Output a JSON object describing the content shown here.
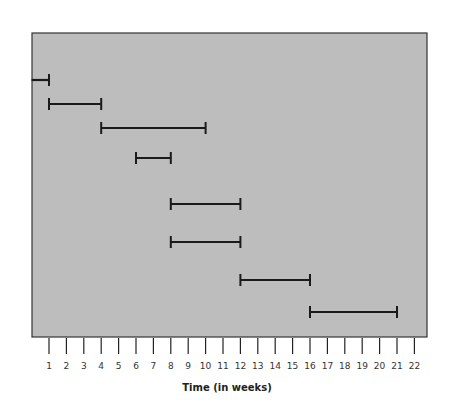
{
  "chart_data": {
    "type": "gantt",
    "title": "",
    "xlabel": "Time (in weeks)",
    "ylabel": "",
    "x_ticks": [
      1,
      2,
      3,
      4,
      5,
      6,
      7,
      8,
      9,
      10,
      11,
      12,
      13,
      14,
      15,
      16,
      17,
      18,
      19,
      20,
      21,
      22
    ],
    "xlim": [
      0,
      23
    ],
    "grid": false,
    "legend": null,
    "background_color": "#bdbdbd",
    "bar_color": "#1a1a1a",
    "tasks": [
      {
        "row": 1,
        "start": 0,
        "end": 1
      },
      {
        "row": 2,
        "start": 1,
        "end": 4
      },
      {
        "row": 3,
        "start": 4,
        "end": 10
      },
      {
        "row": 4,
        "start": 6,
        "end": 8
      },
      {
        "row": 5,
        "start": 8,
        "end": 12
      },
      {
        "row": 6,
        "start": 8,
        "end": 12
      },
      {
        "row": 7,
        "start": 12,
        "end": 16
      },
      {
        "row": 8,
        "start": 16,
        "end": 21
      }
    ],
    "row_y": [
      80,
      104,
      128,
      158,
      204,
      242,
      280,
      312
    ]
  }
}
